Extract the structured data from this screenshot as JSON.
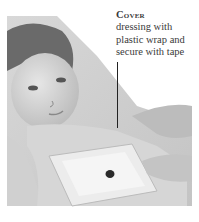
{
  "caption": {
    "title": "Cover",
    "body_lines": [
      "dressing with",
      "plastic wrap and",
      "secure with tape"
    ]
  },
  "image": {
    "description": "Grayscale photo of a child lying down while an adult's hands secure a plastic-wrap covered dressing on the chest with tape",
    "style": "grayscale"
  }
}
